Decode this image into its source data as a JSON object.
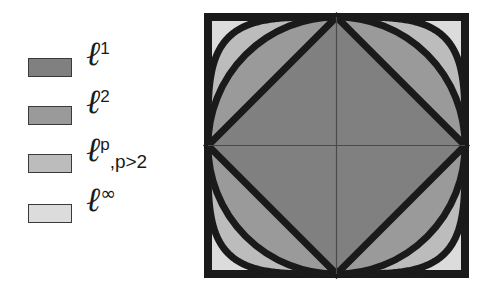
{
  "figure": {
    "title": ""
  },
  "legend": {
    "position": "left",
    "items": [
      {
        "label_base": "ℓ",
        "exponent": "1",
        "condition": "",
        "color": "#808080",
        "name": "l1"
      },
      {
        "label_base": "ℓ",
        "exponent": "2",
        "condition": "",
        "color": "#9a9a9a",
        "name": "l2"
      },
      {
        "label_base": "ℓ",
        "exponent": "p",
        "condition": ",p>2",
        "color": "#bcbcbc",
        "name": "lp"
      },
      {
        "label_base": "ℓ",
        "exponent": "∞",
        "condition": "",
        "color": "#dcdcdc",
        "name": "linf"
      }
    ]
  },
  "chart_data": {
    "type": "diagram",
    "title": "",
    "xlabel": "",
    "ylabel": "",
    "xlim": [
      -1,
      1
    ],
    "ylim": [
      -1,
      1
    ],
    "grid": false,
    "axes_crosshair": true,
    "series": [
      {
        "name": "ℓ¹",
        "p": 1,
        "shape": "diamond",
        "fill": "#808080",
        "stroke": "#1a1a1a",
        "stroke_width": 7
      },
      {
        "name": "ℓ²",
        "p": 2,
        "shape": "circle",
        "fill": "#9a9a9a",
        "stroke": "#1a1a1a",
        "stroke_width": 7
      },
      {
        "name": "ℓᵖ",
        "p": 4,
        "shape": "squircle",
        "fill": "#bcbcbc",
        "stroke": "#1a1a1a",
        "stroke_width": 7
      },
      {
        "name": "ℓ∞",
        "p": "∞",
        "shape": "square",
        "fill": "#dcdcdc",
        "stroke": "#1a1a1a",
        "stroke_width": 8
      }
    ]
  },
  "colors": {
    "fill_l1": "#808080",
    "fill_l2": "#9a9a9a",
    "fill_lp": "#bcbcbc",
    "fill_linf": "#dcdcdc",
    "outline": "#1a1a1a",
    "axis": "#4a4a4a",
    "background": "#ffffff"
  }
}
